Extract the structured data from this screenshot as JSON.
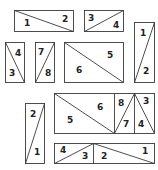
{
  "diagram": {
    "title": "",
    "colors": {
      "line": "#3a3a3a",
      "text": "#222222",
      "background": "#ffffff"
    },
    "shapes": [
      {
        "id": "shape-a",
        "rect": [
          14,
          10,
          59,
          21
        ],
        "lines": [
          [
            14,
            10,
            73,
            31
          ]
        ],
        "labels": [
          {
            "text": "1",
            "x": 24,
            "y": 26
          },
          {
            "text": "2",
            "x": 62,
            "y": 22
          }
        ]
      },
      {
        "id": "shape-b",
        "rect": [
          84,
          10,
          39,
          21
        ],
        "lines": [
          [
            84,
            31,
            123,
            10
          ]
        ],
        "labels": [
          {
            "text": "3",
            "x": 88,
            "y": 21
          },
          {
            "text": "4",
            "x": 113,
            "y": 28
          }
        ]
      },
      {
        "id": "shape-c",
        "rect": [
          5,
          42,
          19,
          40
        ],
        "lines": [
          [
            5,
            42,
            24,
            82
          ]
        ],
        "labels": [
          {
            "text": "4",
            "x": 15,
            "y": 56
          },
          {
            "text": "3",
            "x": 9,
            "y": 76
          }
        ]
      },
      {
        "id": "shape-d",
        "rect": [
          35,
          42,
          19,
          40
        ],
        "lines": [
          [
            35,
            82,
            54,
            42
          ]
        ],
        "labels": [
          {
            "text": "7",
            "x": 38,
            "y": 55
          },
          {
            "text": "8",
            "x": 45,
            "y": 76
          }
        ]
      },
      {
        "id": "shape-e",
        "rect": [
          64,
          42,
          59,
          40
        ],
        "lines": [
          [
            64,
            42,
            123,
            82
          ]
        ],
        "labels": [
          {
            "text": "5",
            "x": 107,
            "y": 58
          },
          {
            "text": "6",
            "x": 76,
            "y": 73
          }
        ]
      },
      {
        "id": "shape-f",
        "rect": [
          134,
          22,
          20,
          60
        ],
        "lines": [
          [
            134,
            82,
            154,
            22
          ]
        ],
        "labels": [
          {
            "text": "1",
            "x": 140,
            "y": 36
          },
          {
            "text": "2",
            "x": 143,
            "y": 74
          }
        ]
      },
      {
        "id": "shape-g",
        "rect": [
          25,
          103,
          19,
          60
        ],
        "lines": [
          [
            25,
            163,
            44,
            103
          ]
        ],
        "labels": [
          {
            "text": "2",
            "x": 30,
            "y": 117
          },
          {
            "text": "1",
            "x": 34,
            "y": 155
          }
        ]
      },
      {
        "id": "shape-h",
        "rect": [
          54,
          93,
          100,
          40
        ],
        "lines": [
          [
            54,
            93,
            114,
            133
          ],
          [
            114,
            93,
            114,
            133
          ],
          [
            134,
            93,
            134,
            133
          ],
          [
            114,
            133,
            134,
            93
          ],
          [
            134,
            93,
            154,
            133
          ]
        ],
        "labels": [
          {
            "text": "6",
            "x": 97,
            "y": 110
          },
          {
            "text": "5",
            "x": 67,
            "y": 123
          },
          {
            "text": "8",
            "x": 118,
            "y": 106
          },
          {
            "text": "7",
            "x": 123,
            "y": 127
          },
          {
            "text": "3",
            "x": 143,
            "y": 104
          },
          {
            "text": "4",
            "x": 138,
            "y": 127
          }
        ]
      },
      {
        "id": "shape-i",
        "rect": [
          54,
          143,
          100,
          20
        ],
        "lines": [
          [
            93,
            143,
            93,
            163
          ],
          [
            54,
            163,
            93,
            143
          ],
          [
            93,
            143,
            154,
            163
          ]
        ],
        "labels": [
          {
            "text": "4",
            "x": 60,
            "y": 153
          },
          {
            "text": "3",
            "x": 82,
            "y": 159
          },
          {
            "text": "2",
            "x": 101,
            "y": 159
          },
          {
            "text": "1",
            "x": 142,
            "y": 154
          }
        ]
      }
    ]
  }
}
